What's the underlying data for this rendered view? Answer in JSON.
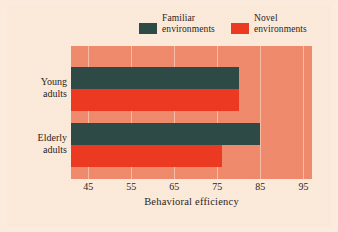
{
  "chart_data": {
    "type": "bar",
    "orientation": "horizontal",
    "title": "",
    "xlabel": "Behavioral efficiency",
    "ylabel": "",
    "categories": [
      "Young adults",
      "Elderly adults"
    ],
    "category_lines": [
      [
        "Young",
        "adults"
      ],
      [
        "Elderly",
        "adults"
      ]
    ],
    "series": [
      {
        "name": "Familiar environments",
        "color": "#2e4a47",
        "values": [
          80,
          85
        ]
      },
      {
        "name": "Novel environments",
        "color": "#ec3a21",
        "values": [
          80,
          76
        ]
      }
    ],
    "xlim": [
      41,
      97
    ],
    "xticks": [
      45,
      55,
      65,
      75,
      85,
      95
    ],
    "xtick_labels": [
      "45",
      "55",
      "65",
      "75",
      "85",
      "95"
    ],
    "grid": true,
    "legend_position": "top",
    "plot_background": "#f08a6d",
    "page_background": "#fbeada",
    "gridline_color": "#f9cdbb"
  },
  "legend": {
    "entries": [
      {
        "label_line1": "Familiar",
        "label_line2": "environments",
        "swatch": "#2e4a47"
      },
      {
        "label_line1": "Novel",
        "label_line2": "environments",
        "swatch": "#ec3a21"
      }
    ]
  },
  "axis": {
    "x_title": "Behavioral efficiency",
    "ticks": [
      "45",
      "55",
      "65",
      "75",
      "85",
      "95"
    ],
    "y_categories": [
      {
        "line1": "Young",
        "line2": "adults"
      },
      {
        "line1": "Elderly",
        "line2": "adults"
      }
    ]
  }
}
